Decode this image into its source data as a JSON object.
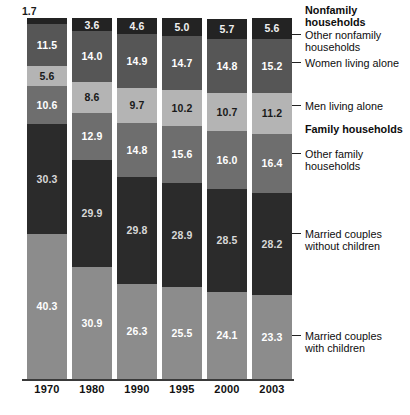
{
  "chart_data": {
    "type": "bar",
    "subtype": "stacked-100-percent",
    "title": "",
    "xlabel": "",
    "ylabel": "",
    "ylim": [
      0,
      100
    ],
    "grid": false,
    "legend_position": "right",
    "categories": [
      "1970",
      "1980",
      "1990",
      "1995",
      "2000",
      "2003"
    ],
    "stack_order_bottom_to_top": [
      "Married couples with children",
      "Married couples without children",
      "Other family households",
      "Men living alone",
      "Women living alone",
      "Other nonfamily households"
    ],
    "series": [
      {
        "name": "Married couples with children",
        "group": "Family households",
        "color": "#8c8c8c",
        "label_color": "#ffffff",
        "values": [
          40.3,
          30.9,
          26.3,
          25.5,
          24.1,
          23.3
        ]
      },
      {
        "name": "Married couples without children",
        "group": "Family households",
        "color": "#2b2b2b",
        "label_color": "#d8d8d8",
        "values": [
          30.3,
          29.9,
          29.8,
          28.9,
          28.5,
          28.2
        ]
      },
      {
        "name": "Other family households",
        "group": "Family households",
        "color": "#6e6e6e",
        "label_color": "#ffffff",
        "values": [
          10.6,
          12.9,
          14.8,
          15.6,
          16.0,
          16.4
        ]
      },
      {
        "name": "Men living alone",
        "group": "Nonfamily households",
        "color": "#b4b4b4",
        "label_color": "#1a1a1a",
        "values": [
          5.6,
          8.6,
          9.7,
          10.2,
          10.7,
          11.2
        ]
      },
      {
        "name": "Women living alone",
        "group": "Nonfamily households",
        "color": "#565656",
        "label_color": "#ffffff",
        "values": [
          11.5,
          14.0,
          14.9,
          14.7,
          14.8,
          15.2
        ]
      },
      {
        "name": "Other nonfamily households",
        "group": "Nonfamily households",
        "color": "#232323",
        "label_color": "#f0f0f0",
        "values": [
          1.7,
          3.6,
          4.6,
          5.0,
          5.7,
          5.6
        ]
      }
    ],
    "value_labels": {
      "1970": {
        "other_nonfamily": "1.7",
        "women_alone": "11.5",
        "men_alone": "5.6",
        "other_family": "10.6",
        "married_without_children": "30.3",
        "married_with_children": "40.3"
      },
      "1980": {
        "other_nonfamily": "3.6",
        "women_alone": "14.0",
        "men_alone": "8.6",
        "other_family": "12.9",
        "married_without_children": "29.9",
        "married_with_children": "30.9"
      },
      "1990": {
        "other_nonfamily": "4.6",
        "women_alone": "14.9",
        "men_alone": "9.7",
        "other_family": "14.8",
        "married_without_children": "29.8",
        "married_with_children": "26.3"
      },
      "1995": {
        "other_nonfamily": "5.0",
        "women_alone": "14.7",
        "men_alone": "10.2",
        "other_family": "15.6",
        "married_without_children": "28.9",
        "married_with_children": "25.5"
      },
      "2000": {
        "other_nonfamily": "5.7",
        "women_alone": "14.8",
        "men_alone": "10.7",
        "other_family": "16.0",
        "married_without_children": "28.5",
        "married_with_children": "24.1"
      },
      "2003": {
        "other_nonfamily": "5.6",
        "women_alone": "15.2",
        "men_alone": "11.2",
        "other_family": "16.4",
        "married_without_children": "28.2",
        "married_with_children": "23.3"
      }
    },
    "annotations": [
      {
        "text": "Nonfamily households",
        "bold": true,
        "has_leader": false
      },
      {
        "text": "Other nonfamily households",
        "bold": false,
        "has_leader": true
      },
      {
        "text": "Women living alone",
        "bold": false,
        "has_leader": true
      },
      {
        "text": "Men living alone",
        "bold": false,
        "has_leader": true
      },
      {
        "text": "Family households",
        "bold": true,
        "has_leader": false
      },
      {
        "text": "Other family households",
        "bold": false,
        "has_leader": true
      },
      {
        "text": "Married couples without children",
        "bold": false,
        "has_leader": true
      },
      {
        "text": "Married couples with children",
        "bold": false,
        "has_leader": true
      }
    ]
  },
  "axis": {
    "ticks": [
      "1970",
      "1980",
      "1990",
      "1995",
      "2000",
      "2003"
    ]
  },
  "legend": {
    "entries": [
      {
        "line1": "Nonfamily",
        "line2": "households",
        "bold": true
      },
      {
        "line1": "Other nonfamily",
        "line2": "households",
        "bold": false
      },
      {
        "line1": "Women living alone",
        "line2": "",
        "bold": false
      },
      {
        "line1": "Men living alone",
        "line2": "",
        "bold": false
      },
      {
        "line1": "Family households",
        "line2": "",
        "bold": true
      },
      {
        "line1": "Other family",
        "line2": "households",
        "bold": false
      },
      {
        "line1": "Married couples",
        "line2": "without children",
        "bold": false
      },
      {
        "line1": "Married couples",
        "line2": "with children",
        "bold": false
      }
    ]
  },
  "floating": {
    "first_bar_top_value": "1.7"
  }
}
